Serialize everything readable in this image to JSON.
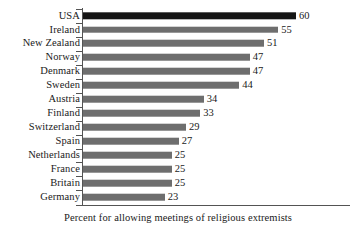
{
  "chart_data": {
    "type": "bar",
    "orientation": "horizontal",
    "title": "",
    "subtitle": "",
    "xlabel": "Percent for allowing meetings of religious extremists",
    "ylabel": "",
    "categories": [
      "USA",
      "Ireland",
      "New Zealand",
      "Norway",
      "Denmark",
      "Sweden",
      "Austria",
      "Finland",
      "Switzerland",
      "Spain",
      "Netherlands",
      "France",
      "Britain",
      "Germany"
    ],
    "values": [
      60,
      55,
      51,
      47,
      47,
      44,
      34,
      33,
      29,
      27,
      25,
      25,
      25,
      23
    ],
    "value_labels": [
      "60",
      "55",
      "51",
      "47",
      "47",
      "44",
      "34",
      "33",
      "29",
      "27",
      "25",
      "25",
      "25",
      "23"
    ],
    "highlighted_category": "USA",
    "xlim": [
      0,
      75
    ],
    "grid": false,
    "legend": false,
    "data_labels": true,
    "colors": {
      "bar": "#6e6e6e",
      "bar_highlight": "#151515",
      "axis": "#545454",
      "text": "#1a1a1a",
      "background": "#ffffff"
    }
  },
  "caption": {
    "text": "Percent for allowing meetings of religious extremists"
  }
}
